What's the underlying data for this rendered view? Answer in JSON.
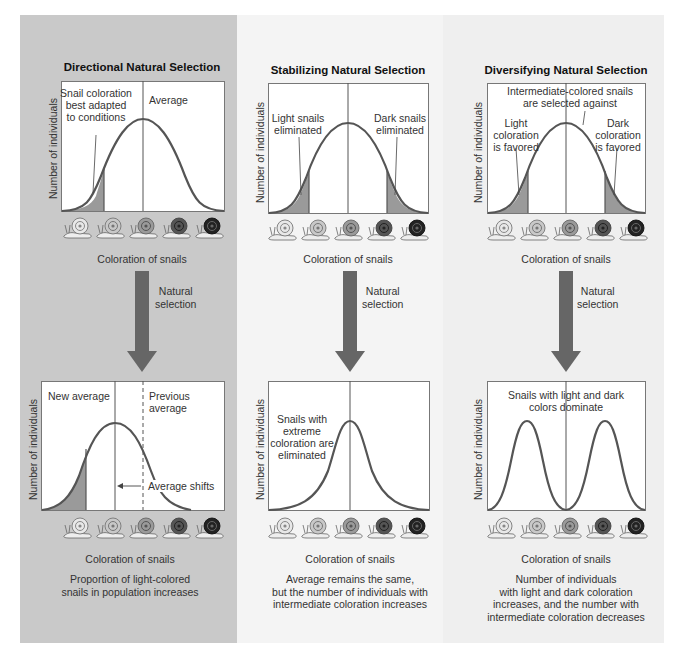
{
  "figure": {
    "panels": [
      {
        "id": "directional",
        "title": "Directional Natural Selection",
        "y_axis_label": "Number of individuals",
        "x_axis_label": "Coloration of snails",
        "before": {
          "annotations": [
            "Snail coloration best adapted to conditions",
            "Average"
          ],
          "annotation_lines": {
            "snail_coloration": [
              "Snail coloration",
              "best adapted",
              "to conditions"
            ]
          }
        },
        "arrow_label": [
          "Natural",
          "selection"
        ],
        "after": {
          "annotations": {
            "new_average": "New average",
            "previous_average": [
              "Previous",
              "average"
            ],
            "shift": "Average shifts"
          }
        },
        "result_caption": [
          "Proportion of light-colored",
          "snails in population increases"
        ]
      },
      {
        "id": "stabilizing",
        "title": "Stabilizing Natural Selection",
        "y_axis_label": "Number of individuals",
        "x_axis_label": "Coloration of snails",
        "before": {
          "annotations": {
            "light": [
              "Light snails",
              "eliminated"
            ],
            "dark": [
              "Dark snails",
              "eliminated"
            ]
          }
        },
        "arrow_label": [
          "Natural",
          "selection"
        ],
        "after": {
          "annotations": {
            "extreme": [
              "Snails with",
              "extreme",
              "coloration are",
              "eliminated"
            ]
          }
        },
        "result_caption": [
          "Average remains the same,",
          "but the number of individuals with",
          "intermediate coloration increases"
        ]
      },
      {
        "id": "diversifying",
        "title": "Diversifying Natural Selection",
        "y_axis_label": "Number of individuals",
        "x_axis_label": "Coloration of snails",
        "before": {
          "annotations": {
            "intermediate": [
              "Intermediate-colored snails",
              "are selected against"
            ],
            "light": [
              "Light",
              "coloration",
              "is favored"
            ],
            "dark": [
              "Dark",
              "coloration",
              "is favored"
            ]
          }
        },
        "arrow_label": [
          "Natural",
          "selection"
        ],
        "after": {
          "annotations": {
            "dominate": [
              "Snails with light and dark",
              "colors dominate"
            ]
          }
        },
        "result_caption": [
          "Number of individuals",
          "with light and dark coloration",
          "increases, and the number with",
          "intermediate coloration decreases"
        ]
      }
    ],
    "snail_shades": [
      "#e8e8e8",
      "#c8c8c8",
      "#9a9a9a",
      "#555555",
      "#222222"
    ],
    "colors": {
      "curve": "#555555",
      "shaded_area": "#9a9a9a",
      "arrow": "#666666",
      "left_panel_bg": "#c9c9c9",
      "mid_panel_bg": "#f4f4f4",
      "right_panel_bg": "#efefef"
    }
  }
}
